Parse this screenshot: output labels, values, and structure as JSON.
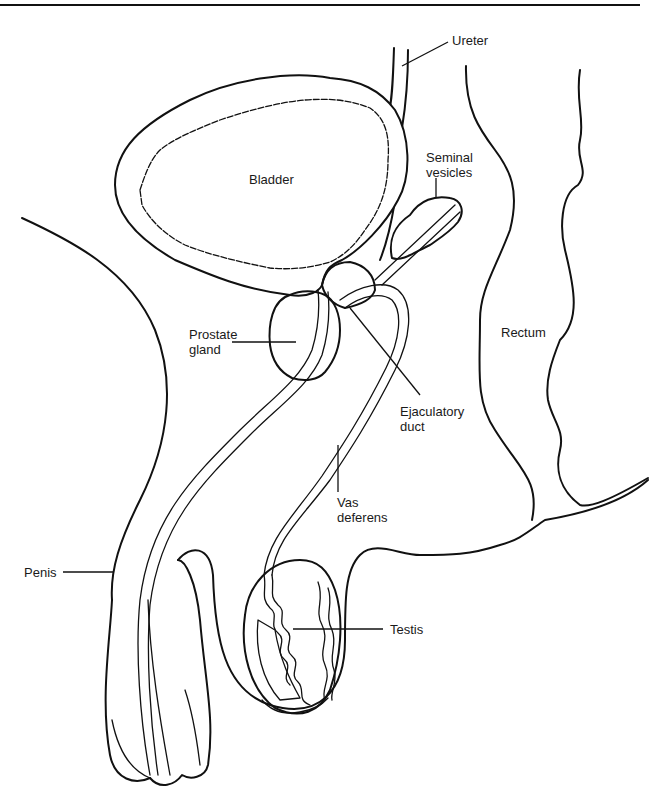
{
  "figure": {
    "type": "anatomical-diagram",
    "line_color": "#111111",
    "background": "#ffffff"
  },
  "labels": {
    "ureter": "Ureter",
    "seminal_vesicles_1": "Seminal",
    "seminal_vesicles_2": "vesicles",
    "bladder": "Bladder",
    "prostate_1": "Prostate",
    "prostate_2": "gland",
    "rectum": "Rectum",
    "ejaculatory_1": "Ejaculatory",
    "ejaculatory_2": "duct",
    "vas_1": "Vas",
    "vas_2": "deferens",
    "penis": "Penis",
    "testis": "Testis"
  }
}
